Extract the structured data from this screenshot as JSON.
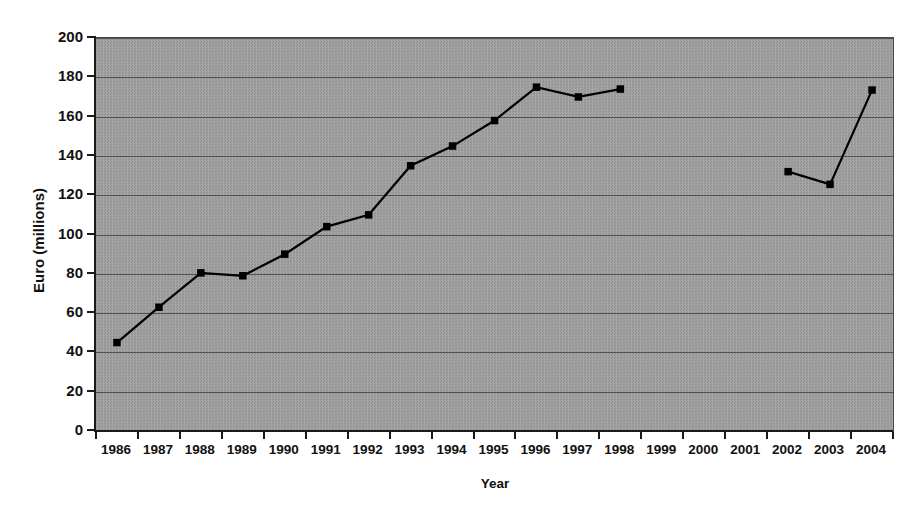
{
  "chart_data": {
    "type": "line",
    "title": "",
    "xlabel": "Year",
    "ylabel": "Euro (millions)",
    "categories": [
      "1986",
      "1987",
      "1988",
      "1989",
      "1990",
      "1991",
      "1992",
      "1993",
      "1994",
      "1995",
      "1996",
      "1997",
      "1998",
      "1999",
      "2000",
      "2001",
      "2002",
      "2003",
      "2004"
    ],
    "values": [
      45,
      63,
      80.5,
      79,
      90,
      104,
      110,
      135,
      145,
      158,
      175,
      170,
      174,
      null,
      null,
      null,
      132,
      125.5,
      173.5
    ],
    "series": [
      {
        "name": "Euro (millions)",
        "values": [
          45,
          63,
          80.5,
          79,
          90,
          104,
          110,
          135,
          145,
          158,
          175,
          170,
          174,
          null,
          null,
          null,
          132,
          125.5,
          173.5
        ]
      }
    ],
    "ylim": [
      0,
      200
    ],
    "ytick_labels": [
      "0",
      "20",
      "40",
      "60",
      "80",
      "100",
      "120",
      "140",
      "160",
      "180",
      "200"
    ],
    "ytick_values": [
      0,
      20,
      40,
      60,
      80,
      100,
      120,
      140,
      160,
      180,
      200
    ],
    "grid": true,
    "grid_axis": "y",
    "legend": false,
    "legend_position": "none",
    "marker": "square",
    "line_color": "#000000",
    "marker_color": "#000000",
    "plot_background_color": "#9c9c9c",
    "gridline_color": "#515151",
    "axis_color": "#1a1a1a",
    "figure_background_color": "#ffffff"
  }
}
